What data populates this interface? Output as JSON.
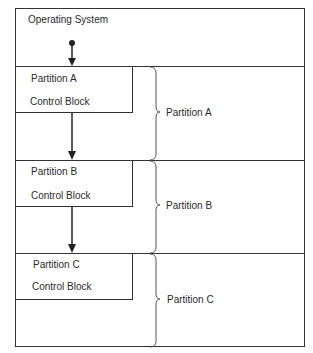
{
  "diagram": {
    "os_region": {
      "label": "Operating System"
    },
    "partitions": [
      {
        "name": "Partition A",
        "control_block": {
          "line1": "Partition A",
          "line2": "Control Block"
        },
        "brace_label": "Partition A"
      },
      {
        "name": "Partition B",
        "control_block": {
          "line1": "Partition B",
          "line2": "Control Block"
        },
        "brace_label": "Partition B"
      },
      {
        "name": "Partition C",
        "control_block": {
          "line1": "Partition C",
          "line2": "Control Block"
        },
        "brace_label": "Partition C"
      }
    ],
    "colors": {
      "line": "#333333",
      "text": "#2a2a2a",
      "background": "#ffffff"
    }
  }
}
